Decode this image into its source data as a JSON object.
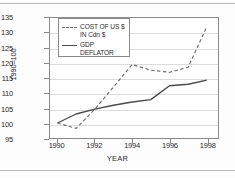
{
  "chart_data": {
    "type": "line",
    "title": "",
    "xlabel": "YEAR",
    "ylabel": "1990=100",
    "x": [
      1990,
      1991,
      1992,
      1993,
      1994,
      1995,
      1996,
      1997,
      1998
    ],
    "xticks": [
      "1990",
      "1992",
      "1994",
      "1996",
      "1998"
    ],
    "xtick_values": [
      1990,
      1992,
      1994,
      1996,
      1998
    ],
    "yticks": [
      "95",
      "100",
      "105",
      "110",
      "115",
      "120",
      "125",
      "130",
      "135"
    ],
    "ytick_values": [
      95,
      100,
      105,
      110,
      115,
      120,
      125,
      130,
      135
    ],
    "xlim": [
      1989.6,
      1998.6
    ],
    "ylim": [
      95,
      135
    ],
    "grid": "horizontal",
    "legend_position": "upper-left-inside",
    "series": [
      {
        "name": "COST OF US $ IN Cdn $",
        "style": "dashed",
        "color": "#6e6e6e",
        "values": [
          100.0,
          98.2,
          104.6,
          112.0,
          119.5,
          117.6,
          116.9,
          118.6,
          132.1
        ]
      },
      {
        "name": "GDP DEFLATOR",
        "style": "solid",
        "color": "#4a4a4a",
        "values": [
          100.0,
          103.0,
          104.6,
          105.9,
          107.0,
          107.8,
          112.4,
          112.9,
          114.3
        ]
      }
    ],
    "legend": [
      {
        "label_line1": "COST OF US $",
        "label_line2": "IN Cdn $",
        "style": "dashed"
      },
      {
        "label_line1": "GDP DEFLATOR",
        "label_line2": "",
        "style": "solid"
      }
    ]
  },
  "colors": {
    "background": "#ffffff",
    "axis": "#8a8a8a",
    "gridline": "#dcdcdc",
    "text": "#2b2b2b",
    "rule": "#b9b9b9"
  }
}
